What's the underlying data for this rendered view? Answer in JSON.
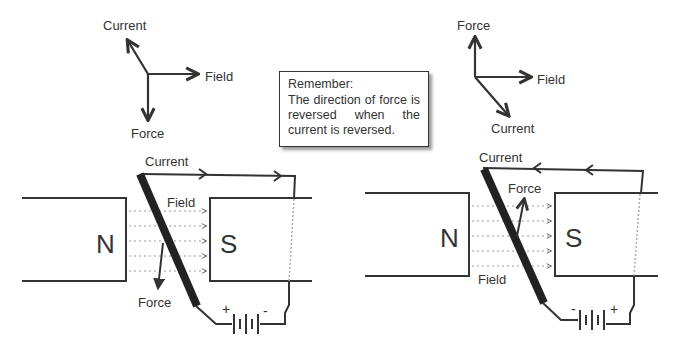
{
  "note": {
    "title": "Remember:",
    "body": "The direction of force is reversed when the current is reversed."
  },
  "left": {
    "legend": {
      "current": "Current",
      "field": "Field",
      "force": "Force"
    },
    "magnet_n": "N",
    "magnet_s": "S",
    "current_label": "Current",
    "field_label": "Field",
    "force_label": "Force",
    "battery_pos": "+",
    "battery_neg": "-"
  },
  "right": {
    "legend": {
      "current": "Current",
      "field": "Field",
      "force": "Force"
    },
    "magnet_n": "N",
    "magnet_s": "S",
    "current_label": "Current",
    "field_label": "Field",
    "force_label": "Force",
    "battery_pos": "+",
    "battery_neg": "-"
  },
  "colors": {
    "line": "#333333",
    "dotted": "#999999",
    "bg": "#ffffff"
  }
}
